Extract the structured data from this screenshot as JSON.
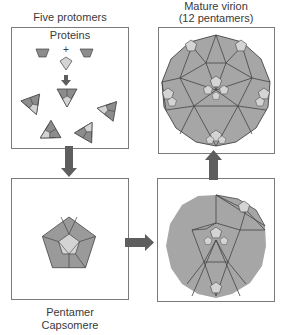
{
  "panels": {
    "protomers": {
      "title": "Five protomers",
      "subtitle": "Proteins",
      "plus": "+"
    },
    "pentamer": {
      "caption_line1": "Pentamer",
      "caption_line2": "Capsomere"
    },
    "partial": {
      "caption": ""
    },
    "virion": {
      "title_line1": "Mature virion",
      "title_line2": "(12 pentamers)"
    }
  },
  "colors": {
    "dark_protein": "#8c8c8c",
    "light_protein": "#d4d4d4",
    "capsid_fill": "#a6a6a6",
    "outline": "#444444",
    "arrow": "#5e5e5e",
    "box_border": "#7a7a7a"
  }
}
